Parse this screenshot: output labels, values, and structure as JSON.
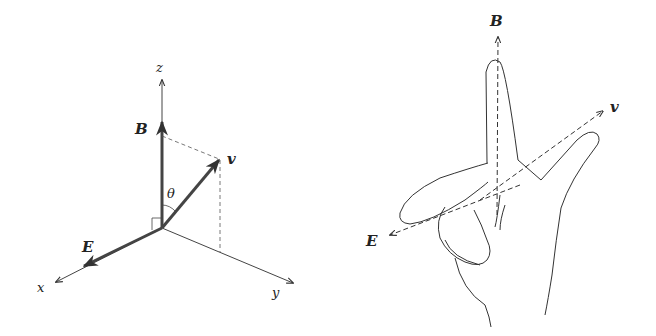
{
  "left_diagram": {
    "axes": {
      "x": "x",
      "y": "y",
      "z": "z"
    },
    "vectors": {
      "B": "B",
      "E": "E",
      "v": "v"
    },
    "angle": "θ"
  },
  "right_diagram": {
    "vectors": {
      "B": "B",
      "E": "E",
      "v": "v"
    }
  },
  "colors": {
    "stroke": "#333333",
    "background": "#ffffff"
  }
}
